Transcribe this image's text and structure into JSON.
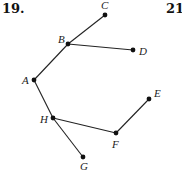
{
  "problems": {
    "left_number": "19.",
    "right_number": "21."
  },
  "graph": {
    "type": "tree",
    "nodes": [
      {
        "id": "A",
        "label": "A",
        "x": 34,
        "y": 80,
        "lx": 22,
        "ly": 84
      },
      {
        "id": "B",
        "label": "B",
        "x": 68,
        "y": 44,
        "lx": 58,
        "ly": 43
      },
      {
        "id": "C",
        "label": "C",
        "x": 105,
        "y": 15,
        "lx": 101,
        "ly": 9
      },
      {
        "id": "D",
        "label": "D",
        "x": 133,
        "y": 50,
        "lx": 139,
        "ly": 55
      },
      {
        "id": "E",
        "label": "E",
        "x": 149,
        "y": 99,
        "lx": 154,
        "ly": 97
      },
      {
        "id": "F",
        "label": "F",
        "x": 116,
        "y": 133,
        "lx": 112,
        "ly": 148
      },
      {
        "id": "G",
        "label": "G",
        "x": 83,
        "y": 157,
        "lx": 80,
        "ly": 170
      },
      {
        "id": "H",
        "label": "H",
        "x": 53,
        "y": 118,
        "lx": 40,
        "ly": 123
      }
    ],
    "edges": [
      [
        "A",
        "B"
      ],
      [
        "B",
        "C"
      ],
      [
        "B",
        "D"
      ],
      [
        "A",
        "H"
      ],
      [
        "H",
        "G"
      ],
      [
        "H",
        "F"
      ],
      [
        "F",
        "E"
      ]
    ],
    "colors": {
      "stroke": "#222222",
      "node": "#111111"
    }
  }
}
